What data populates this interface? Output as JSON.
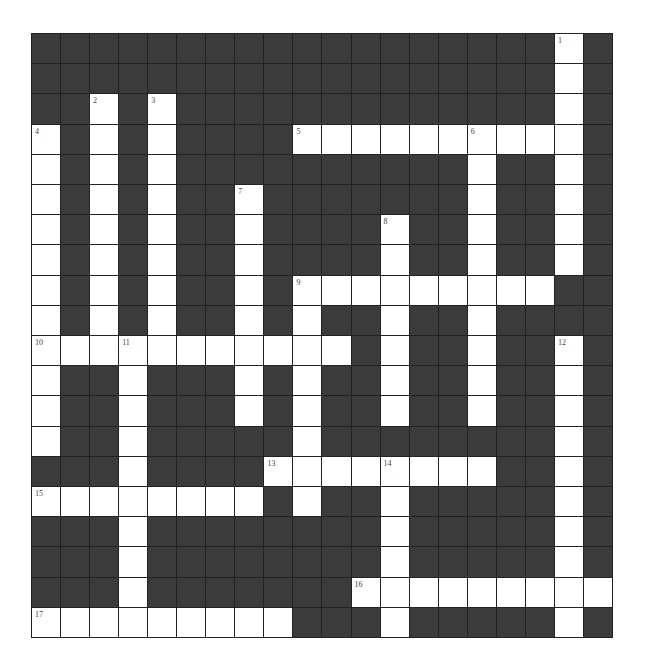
{
  "puzzle": {
    "rows": 20,
    "cols": 20,
    "colors": {
      "block": "#3b3b3b",
      "open": "#ffffff",
      "grid_line": "#222222"
    },
    "layout": [
      "..................W.",
      "..................W.",
      "..W.W.............W.",
      "W.W.W....WWWWWWWWWW.",
      "W.W.W..........W..W.",
      "W.W.W..W.......W..W.",
      "W.W.W..W....W..W..W.",
      "W.W.W..W....W..W..W.",
      "W.W.W..W.WWWWWWWWW..",
      "W.W.W..W.W..W..W....",
      "WWWWWWWWWWW.W..W..W.",
      "W..W...W.W..W..W..W.",
      "W..W...W.W..W..W..W.",
      "W..W.....W........W.",
      "...W....WWWWWWWW..W.",
      "WWWWWWWW.W..W.....W.",
      "...W........W.....W.",
      "...W........W.....W.",
      "...W.......WWWWWWWWW",
      "WWWWWWWWW...W.....W."
    ],
    "clue_numbers": [
      {
        "number": "1",
        "row": 0,
        "col": 18
      },
      {
        "number": "2",
        "row": 2,
        "col": 2
      },
      {
        "number": "3",
        "row": 2,
        "col": 4
      },
      {
        "number": "4",
        "row": 3,
        "col": 0
      },
      {
        "number": "5",
        "row": 3,
        "col": 9
      },
      {
        "number": "6",
        "row": 3,
        "col": 15
      },
      {
        "number": "7",
        "row": 5,
        "col": 7
      },
      {
        "number": "8",
        "row": 6,
        "col": 12
      },
      {
        "number": "9",
        "row": 8,
        "col": 9
      },
      {
        "number": "10",
        "row": 10,
        "col": 0
      },
      {
        "number": "11",
        "row": 10,
        "col": 3
      },
      {
        "number": "12",
        "row": 10,
        "col": 18
      },
      {
        "number": "13",
        "row": 14,
        "col": 8
      },
      {
        "number": "14",
        "row": 14,
        "col": 12
      },
      {
        "number": "15",
        "row": 15,
        "col": 0
      },
      {
        "number": "16",
        "row": 18,
        "col": 11
      },
      {
        "number": "17",
        "row": 19,
        "col": 0
      }
    ],
    "entries": {
      "across": [
        {
          "number": "5",
          "row": 3,
          "col": 9,
          "length": 10
        },
        {
          "number": "9",
          "row": 8,
          "col": 9,
          "length": 9
        },
        {
          "number": "10",
          "row": 10,
          "col": 0,
          "length": 11
        },
        {
          "number": "13",
          "row": 14,
          "col": 8,
          "length": 8
        },
        {
          "number": "15",
          "row": 15,
          "col": 0,
          "length": 8
        },
        {
          "number": "16",
          "row": 18,
          "col": 11,
          "length": 9
        },
        {
          "number": "17",
          "row": 19,
          "col": 0,
          "length": 9
        }
      ],
      "down": [
        {
          "number": "1",
          "row": 0,
          "col": 18,
          "length": 8
        },
        {
          "number": "2",
          "row": 2,
          "col": 2,
          "length": 9
        },
        {
          "number": "3",
          "row": 2,
          "col": 4,
          "length": 9
        },
        {
          "number": "4",
          "row": 3,
          "col": 0,
          "length": 11
        },
        {
          "number": "6",
          "row": 3,
          "col": 15,
          "length": 10
        },
        {
          "number": "7",
          "row": 5,
          "col": 7,
          "length": 8
        },
        {
          "number": "8",
          "row": 6,
          "col": 12,
          "length": 7
        },
        {
          "number": "9",
          "row": 8,
          "col": 9,
          "length": 8
        },
        {
          "number": "11",
          "row": 10,
          "col": 3,
          "length": 10
        },
        {
          "number": "12",
          "row": 10,
          "col": 18,
          "length": 10
        },
        {
          "number": "14",
          "row": 14,
          "col": 12,
          "length": 6
        }
      ]
    }
  }
}
